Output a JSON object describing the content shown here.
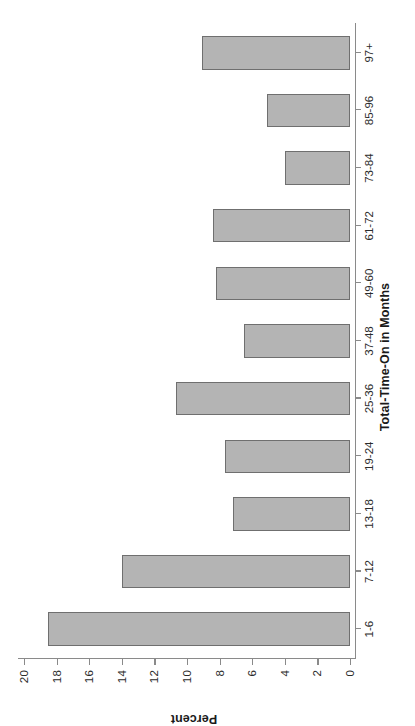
{
  "chart_data": {
    "type": "bar",
    "title": "",
    "subtitle": "",
    "xlabel": "Total-Time-On in Months",
    "ylabel": "Percent",
    "categories": [
      "1-6",
      "7-12",
      "13-18",
      "19-24",
      "25-36",
      "37-48",
      "49-60",
      "61-72",
      "73-84",
      "85-96",
      "97+"
    ],
    "values": [
      18.5,
      14.0,
      7.2,
      7.7,
      10.7,
      6.5,
      8.2,
      8.4,
      4.0,
      5.1,
      9.1
    ],
    "ylim": [
      0,
      20
    ],
    "ytick_step": 2,
    "ytick_labels": [
      "0",
      "2",
      "4",
      "6",
      "8",
      "10",
      "12",
      "14",
      "16",
      "18",
      "20"
    ],
    "grid": false,
    "legend": false,
    "legend_position": "none",
    "orientation": "vertical-bars-page-rotated-90ccw",
    "bar_fill_color": "#b4b4b4",
    "bar_edge_color": "#6f6f6f",
    "axis_color": "#8a8a8a",
    "background_color": "#ffffff"
  }
}
